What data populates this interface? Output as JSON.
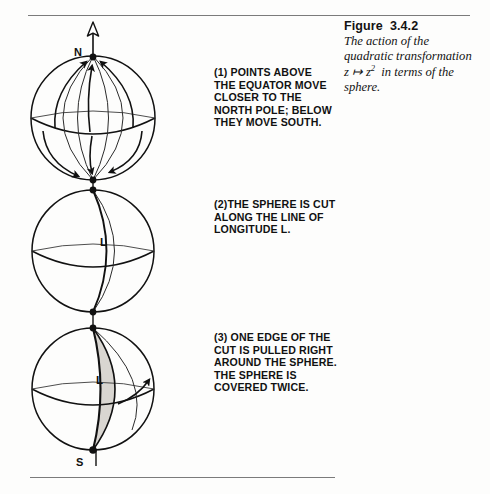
{
  "figure": {
    "title": "Figure  3.4.2",
    "caption_line1": "The action of the",
    "caption_line2": "quadratic transformation",
    "caption_math_z1": "z",
    "caption_math_arrow": "↦",
    "caption_math_z2": "z",
    "caption_math_exp": "2",
    "caption_math_rest": "in terms of the",
    "caption_line4": "sphere."
  },
  "steps": [
    {
      "id": "step-1",
      "text": "(1) POINTS ABOVE\nTHE EQUATOR MOVE\nCLOSER TO THE\nNORTH POLE; BELOW\nTHEY MOVE SOUTH."
    },
    {
      "id": "step-2",
      "text": "(2)THE SPHERE IS CUT\nALONG THE LINE OF\nLONGITUDE L."
    },
    {
      "id": "step-3",
      "text": "(3) ONE EDGE OF THE\nCUT IS PULLED RIGHT\nAROUND THE SPHERE.\nTHE SPHERE IS\nCOVERED TWICE."
    }
  ],
  "diagram": {
    "sphere1": {
      "north_pole_label": "N",
      "axis_arrow": "north-axis-arrow",
      "flow_arrows_up": 3,
      "flow_arrows_down": 3
    },
    "sphere2": {
      "longitude_label": "L"
    },
    "sphere3": {
      "longitude_label": "L",
      "south_pole_label": "S",
      "lune_fill": "#d9d6d1",
      "pull_arrow": "pull-direction-arrow"
    }
  },
  "colors": {
    "ink": "#111111",
    "rule": "#7b7b7b",
    "page": "#fdfdfc",
    "lune": "#d9d6d1"
  }
}
